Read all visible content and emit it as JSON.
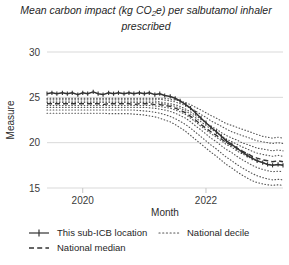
{
  "chart_data": {
    "type": "line",
    "title": "Mean carbon impact (kg CO2e) per salbutamol inhaler prescribed",
    "title_pre": "Mean carbon impact (kg CO",
    "title_sub": "2",
    "title_post": "e) per salbutamol inhaler prescribed",
    "xlabel": "Month",
    "ylabel": "Measure",
    "ylim": [
      15,
      30
    ],
    "xlim": [
      2019.42,
      2023.25
    ],
    "yticks": [
      30,
      25,
      20,
      15
    ],
    "ytick_labels": [
      "30",
      "25",
      "20",
      "15"
    ],
    "xticks": [
      2020,
      2022
    ],
    "xtick_labels": [
      "2020",
      "2022"
    ],
    "grid": true,
    "legend_position": "below",
    "colors": {
      "line": "#333333",
      "median": "#333333",
      "decile": "#555555",
      "grid": "#d9d9d9",
      "text": "#2b2b2b"
    },
    "legend": [
      {
        "label": "This sub-ICB location",
        "style": "solid-marker"
      },
      {
        "label": "National decile",
        "style": "dotted"
      },
      {
        "label": "National median",
        "style": "dashed"
      }
    ],
    "x": [
      2019.42,
      2019.5,
      2019.58,
      2019.67,
      2019.75,
      2019.83,
      2019.92,
      2020.0,
      2020.08,
      2020.17,
      2020.25,
      2020.33,
      2020.42,
      2020.5,
      2020.58,
      2020.67,
      2020.75,
      2020.83,
      2020.92,
      2021.0,
      2021.08,
      2021.17,
      2021.25,
      2021.33,
      2021.42,
      2021.5,
      2021.58,
      2021.67,
      2021.75,
      2021.83,
      2021.92,
      2022.0,
      2022.08,
      2022.17,
      2022.25,
      2022.33,
      2022.42,
      2022.5,
      2022.58,
      2022.67,
      2022.75,
      2022.83,
      2022.92,
      2023.0,
      2023.08,
      2023.17,
      2023.25
    ],
    "series": [
      {
        "name": "This sub-ICB location",
        "style": "solid-marker",
        "values": [
          25.4,
          25.5,
          25.4,
          25.5,
          25.4,
          25.5,
          25.3,
          25.5,
          25.4,
          25.6,
          25.4,
          25.3,
          25.5,
          25.4,
          25.5,
          25.4,
          25.5,
          25.4,
          25.5,
          25.4,
          25.5,
          25.3,
          25.4,
          25.2,
          25.1,
          24.9,
          24.6,
          24.2,
          23.8,
          23.3,
          22.7,
          22.2,
          21.7,
          21.2,
          20.7,
          20.2,
          19.8,
          19.4,
          19.0,
          18.6,
          18.3,
          18.0,
          17.8,
          17.6,
          17.5,
          17.6,
          17.5
        ]
      },
      {
        "name": "National median",
        "style": "dashed",
        "values": [
          24.3,
          24.3,
          24.3,
          24.3,
          24.3,
          24.3,
          24.3,
          24.3,
          24.3,
          24.3,
          24.3,
          24.2,
          24.3,
          24.3,
          24.3,
          24.3,
          24.3,
          24.2,
          24.3,
          24.3,
          24.3,
          24.2,
          24.2,
          24.1,
          24.0,
          23.8,
          23.6,
          23.3,
          22.9,
          22.5,
          22.0,
          21.6,
          21.2,
          20.8,
          20.4,
          20.0,
          19.7,
          19.4,
          19.1,
          18.8,
          18.5,
          18.3,
          18.1,
          18.0,
          17.9,
          18.0,
          17.9
        ]
      },
      {
        "name": "National decile 9",
        "style": "dotted",
        "values": [
          24.9,
          24.9,
          24.9,
          24.9,
          24.9,
          24.9,
          24.9,
          24.9,
          24.9,
          24.9,
          24.9,
          24.9,
          24.9,
          24.9,
          24.9,
          24.9,
          24.9,
          24.9,
          24.9,
          24.9,
          24.9,
          24.9,
          24.9,
          24.9,
          24.8,
          24.7,
          24.6,
          24.4,
          24.2,
          23.9,
          23.6,
          23.3,
          23.0,
          22.7,
          22.4,
          22.1,
          21.9,
          21.7,
          21.5,
          21.3,
          21.1,
          20.9,
          20.7,
          20.6,
          20.5,
          20.6,
          20.5
        ]
      },
      {
        "name": "National decile 8",
        "style": "dotted",
        "values": [
          24.8,
          24.8,
          24.8,
          24.8,
          24.8,
          24.8,
          24.8,
          24.8,
          24.8,
          24.8,
          24.8,
          24.8,
          24.8,
          24.8,
          24.8,
          24.8,
          24.8,
          24.8,
          24.8,
          24.8,
          24.8,
          24.8,
          24.8,
          24.7,
          24.6,
          24.5,
          24.3,
          24.1,
          23.8,
          23.5,
          23.1,
          22.8,
          22.4,
          22.1,
          21.8,
          21.5,
          21.2,
          21.0,
          20.8,
          20.6,
          20.4,
          20.2,
          20.1,
          20.0,
          19.9,
          20.0,
          19.9
        ]
      },
      {
        "name": "National decile 7",
        "style": "dotted",
        "values": [
          24.6,
          24.6,
          24.6,
          24.6,
          24.6,
          24.6,
          24.6,
          24.6,
          24.6,
          24.6,
          24.6,
          24.6,
          24.6,
          24.6,
          24.6,
          24.6,
          24.6,
          24.6,
          24.6,
          24.6,
          24.6,
          24.6,
          24.5,
          24.4,
          24.3,
          24.2,
          24.0,
          23.7,
          23.4,
          23.0,
          22.6,
          22.2,
          21.8,
          21.5,
          21.1,
          20.8,
          20.5,
          20.3,
          20.0,
          19.8,
          19.6,
          19.4,
          19.3,
          19.2,
          19.1,
          19.2,
          19.1
        ]
      },
      {
        "name": "National decile 6",
        "style": "dotted",
        "values": [
          24.45,
          24.45,
          24.45,
          24.45,
          24.45,
          24.45,
          24.45,
          24.45,
          24.45,
          24.45,
          24.45,
          24.45,
          24.45,
          24.45,
          24.45,
          24.45,
          24.45,
          24.45,
          24.45,
          24.45,
          24.45,
          24.4,
          24.35,
          24.25,
          24.15,
          24.0,
          23.8,
          23.5,
          23.15,
          22.75,
          22.3,
          21.9,
          21.5,
          21.15,
          20.75,
          20.4,
          20.1,
          19.85,
          19.55,
          19.3,
          19.05,
          18.85,
          18.7,
          18.6,
          18.5,
          18.6,
          18.5
        ]
      },
      {
        "name": "National decile 4",
        "style": "dotted",
        "values": [
          24.1,
          24.1,
          24.1,
          24.1,
          24.1,
          24.1,
          24.1,
          24.1,
          24.1,
          24.1,
          24.1,
          24.1,
          24.1,
          24.1,
          24.1,
          24.1,
          24.1,
          24.1,
          24.1,
          24.1,
          24.1,
          24.05,
          24.0,
          23.9,
          23.8,
          23.6,
          23.4,
          23.1,
          22.7,
          22.3,
          21.8,
          21.4,
          21.0,
          20.6,
          20.2,
          19.8,
          19.5,
          19.1,
          18.8,
          18.5,
          18.2,
          18.0,
          17.8,
          17.65,
          17.55,
          17.6,
          17.55
        ]
      },
      {
        "name": "National decile 3",
        "style": "dotted",
        "values": [
          23.9,
          23.9,
          23.9,
          23.9,
          23.9,
          23.9,
          23.9,
          23.9,
          23.9,
          23.9,
          23.9,
          23.9,
          23.9,
          23.9,
          23.9,
          23.9,
          23.9,
          23.9,
          23.9,
          23.9,
          23.85,
          23.8,
          23.7,
          23.6,
          23.45,
          23.25,
          23.0,
          22.7,
          22.3,
          21.85,
          21.4,
          20.95,
          20.5,
          20.1,
          19.65,
          19.25,
          18.9,
          18.5,
          18.15,
          17.8,
          17.5,
          17.25,
          17.05,
          16.9,
          16.8,
          16.85,
          16.8
        ]
      },
      {
        "name": "National decile 2",
        "style": "dotted",
        "values": [
          23.6,
          23.6,
          23.6,
          23.6,
          23.6,
          23.6,
          23.6,
          23.6,
          23.6,
          23.6,
          23.6,
          23.6,
          23.6,
          23.6,
          23.6,
          23.6,
          23.6,
          23.6,
          23.55,
          23.5,
          23.45,
          23.35,
          23.25,
          23.1,
          22.9,
          22.65,
          22.35,
          22.0,
          21.6,
          21.15,
          20.65,
          20.2,
          19.75,
          19.3,
          18.85,
          18.4,
          18.0,
          17.6,
          17.25,
          16.9,
          16.6,
          16.35,
          16.15,
          16.0,
          15.9,
          15.95,
          15.9
        ]
      },
      {
        "name": "National decile 1",
        "style": "dotted",
        "values": [
          23.25,
          23.25,
          23.25,
          23.25,
          23.25,
          23.25,
          23.25,
          23.25,
          23.25,
          23.25,
          23.25,
          23.25,
          23.2,
          23.2,
          23.2,
          23.2,
          23.2,
          23.15,
          23.1,
          23.05,
          22.95,
          22.85,
          22.7,
          22.5,
          22.3,
          22.0,
          21.65,
          21.25,
          20.8,
          20.35,
          19.85,
          19.4,
          18.95,
          18.5,
          18.05,
          17.6,
          17.2,
          16.8,
          16.45,
          16.1,
          15.8,
          15.6,
          15.45,
          15.35,
          15.3,
          15.35,
          15.3
        ]
      }
    ]
  }
}
